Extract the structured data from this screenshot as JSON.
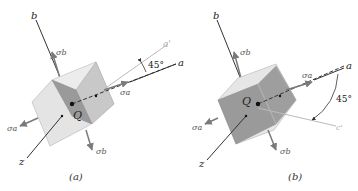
{
  "figure": {
    "panels": [
      {
        "id": "a",
        "caption": "(a)",
        "axis_labels": {
          "b": "b",
          "a": "a",
          "z": "z",
          "rotated": "a'"
        },
        "origin_label": "Q",
        "stress_labels": {
          "sigma_a": "σa",
          "sigma_b": "σb",
          "sigma_a_left": "σa",
          "sigma_b_bottom": "σb"
        },
        "angle_label": "45°",
        "rotation_direction": "counterclockwise"
      },
      {
        "id": "b",
        "caption": "(b)",
        "axis_labels": {
          "b": "b",
          "a": "a",
          "z": "z",
          "rotated": "c'"
        },
        "origin_label": "Q",
        "stress_labels": {
          "sigma_a": "σa",
          "sigma_b": "σb",
          "sigma_a_left": "σa",
          "sigma_b_bottom": "σb"
        },
        "angle_label": "45°",
        "rotation_direction": "clockwise"
      }
    ],
    "colors": {
      "cube_light": "#e4e4e4",
      "cube_mid": "#c8c8c8",
      "cube_dark": "#9a9a9a",
      "axis": "#333333",
      "arrow": "#7a7a7a",
      "rotated_axis": "#bbbbbb"
    }
  }
}
